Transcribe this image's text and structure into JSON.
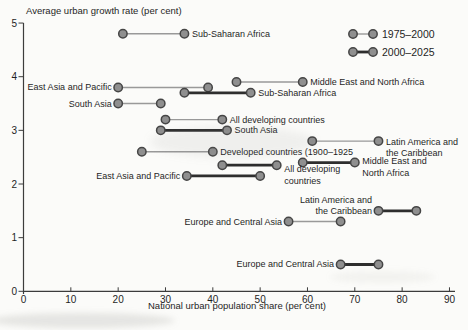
{
  "chart_data": {
    "type": "scatter",
    "subtype": "dumbbell",
    "title": "",
    "ylabel": "Average urban growth rate (per cent)",
    "xlabel": "National urban population share (per cent)",
    "x_axis": {
      "ticks": [
        0,
        10,
        20,
        30,
        40,
        50,
        60,
        70,
        80,
        90
      ],
      "range": [
        0,
        91
      ],
      "grid": false
    },
    "y_axis": {
      "ticks": [
        0,
        1,
        2,
        3,
        4,
        5
      ],
      "range": [
        0,
        5
      ],
      "grid": false
    },
    "legend": [
      {
        "label": "1975–2000",
        "style": "thin"
      },
      {
        "label": "2000–2025",
        "style": "thick"
      }
    ],
    "legend_position": "top-right",
    "colors": {
      "dot_fill": "#8f8f8f",
      "dot_stroke": "#454545",
      "thin_line": "#999999",
      "thick_line": "#2e2e2e",
      "axis": "#3c3c3c",
      "text": "#1f1f1f",
      "background": "#fbfbf9"
    },
    "series": [
      {
        "name": "Sub-Saharan Africa",
        "period": "1975–2000",
        "style": "thin",
        "x1": 21,
        "x2": 34,
        "y": 4.8,
        "label": {
          "lines": [
            "Sub-Saharan Africa"
          ],
          "side": "right",
          "dy": [
            3
          ]
        }
      },
      {
        "name": "Middle East and North Africa",
        "period": "1975–2000",
        "style": "thin",
        "x1": 45,
        "x2": 59,
        "y": 3.9,
        "label": {
          "lines": [
            "Middle East and North Africa"
          ],
          "side": "right",
          "dy": [
            3
          ]
        }
      },
      {
        "name": "East Asia and Pacific",
        "period": "1975–2000",
        "style": "thin",
        "x1": 20,
        "x2": 39,
        "y": 3.8,
        "label": {
          "lines": [
            "East Asia and Pacific"
          ],
          "side": "left",
          "dy": [
            3
          ]
        }
      },
      {
        "name": "Sub-Saharan Africa",
        "period": "2000–2025",
        "style": "thick",
        "x1": 34,
        "x2": 48,
        "y": 3.7,
        "label": {
          "lines": [
            "Sub-Saharan Africa"
          ],
          "side": "right",
          "dy": [
            3
          ]
        }
      },
      {
        "name": "South Asia",
        "period": "1975–2000",
        "style": "thin",
        "x1": 20,
        "x2": 29,
        "y": 3.5,
        "label": {
          "lines": [
            "South Asia"
          ],
          "side": "left",
          "dy": [
            3
          ]
        }
      },
      {
        "name": "All developing countries",
        "period": "1975–2000",
        "style": "thin",
        "x1": 30,
        "x2": 42,
        "y": 3.2,
        "label": {
          "lines": [
            "All developing countries"
          ],
          "side": "right",
          "dy": [
            3
          ]
        }
      },
      {
        "name": "South Asia",
        "period": "2000–2025",
        "style": "thick",
        "x1": 29,
        "x2": 43,
        "y": 3.0,
        "label": {
          "lines": [
            "South Asia"
          ],
          "side": "right",
          "dy": [
            3
          ]
        }
      },
      {
        "name": "Latin America and the Caribbean",
        "period": "1975–2000",
        "style": "thin",
        "x1": 61,
        "x2": 75,
        "y": 2.8,
        "label": {
          "lines": [
            "Latin America and",
            "the Caribbean"
          ],
          "side": "right",
          "dy": [
            4,
            15
          ]
        }
      },
      {
        "name": "Developed countries (1900–1925",
        "period": "1900–1925",
        "style": "thin",
        "x1": 25,
        "x2": 40,
        "y": 2.6,
        "label": {
          "lines": [
            "Developed countries (1900–1925"
          ],
          "side": "right",
          "dy": [
            3
          ]
        }
      },
      {
        "name": "Middle East and North Africa",
        "period": "2000–2025",
        "style": "thick",
        "x1": 59,
        "x2": 70,
        "y": 2.4,
        "label": {
          "lines": [
            "Middle East and",
            "North Africa"
          ],
          "side": "right",
          "dy": [
            1,
            13
          ]
        }
      },
      {
        "name": "All developing countries",
        "period": "2000–2025",
        "style": "thick",
        "x1": 42,
        "x2": 53.5,
        "y": 2.35,
        "label": {
          "lines": [
            "All developing",
            "countries"
          ],
          "side": "right",
          "dy": [
            7,
            19
          ]
        }
      },
      {
        "name": "East Asia and Pacific",
        "period": "2000–2025",
        "style": "thick",
        "x1": 34.5,
        "x2": 50,
        "y": 2.15,
        "label": {
          "lines": [
            "East Asia and Pacific"
          ],
          "side": "left",
          "dy": [
            3
          ]
        }
      },
      {
        "name": "Latin America and the Caribbean",
        "period": "2000–2025",
        "style": "thick",
        "x1": 75,
        "x2": 83,
        "y": 1.5,
        "label": {
          "lines": [
            "Latin America and",
            "the Caribbean"
          ],
          "side": "left",
          "dy": [
            -8,
            3
          ]
        }
      },
      {
        "name": "Europe and Central Asia",
        "period": "1975–2000",
        "style": "thin",
        "x1": 56,
        "x2": 67,
        "y": 1.3,
        "label": {
          "lines": [
            "Europe and Central Asia"
          ],
          "side": "left",
          "dy": [
            3
          ]
        }
      },
      {
        "name": "Europe and Central Asia",
        "period": "2000–2025",
        "style": "thick",
        "x1": 67,
        "x2": 75,
        "y": 0.5,
        "label": {
          "lines": [
            "Europe and Central Asia"
          ],
          "side": "left",
          "dy": [
            3
          ]
        }
      }
    ]
  }
}
